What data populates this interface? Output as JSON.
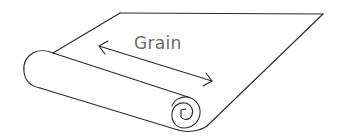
{
  "diagram": {
    "label": "Grain",
    "arrow": {
      "type": "double-headed",
      "meaning": "grain direction"
    },
    "colors": {
      "stroke": "#2a2a2a",
      "label": "#6a6a6a",
      "background": "#ffffff"
    }
  }
}
